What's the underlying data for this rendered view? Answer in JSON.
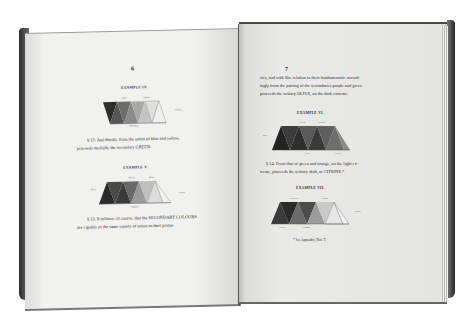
{
  "photo": {
    "subject": "Open antique book on color theory showing triangle color diagrams",
    "background_color": "#ffffff"
  },
  "left_page": {
    "page_number": "6",
    "example_iv": {
      "title": "EXAMPLE IV.",
      "labels": [
        "Red",
        "Yellow",
        "Yellow",
        "ORANGE"
      ]
    },
    "para_13": [
      "§ 13. And thirdly, from the union of blue and yellow,",
      "proceeds medially the secondary GREEN."
    ],
    "example_v": {
      "title": "EXAMPLE V.",
      "labels": [
        "Blue",
        "Yellow",
        "Blue",
        "Green",
        "GREEN"
      ]
    },
    "para_14a": [
      "§ 13. It follows, of course, that the SECONDARY COLOURS",
      "are capable of the same variety of union as their prima-"
    ]
  },
  "right_page": {
    "page_number": "7",
    "para_cont": [
      "ries, and with like relation to their fundamentals: accord-",
      "ingly from the pairing of the secondaries purple and green",
      "proceeds the tertiary OLIVE, on the dark extreme."
    ],
    "example_vi": {
      "title": "EXAMPLE VI.",
      "labels": [
        "Blue",
        "Green",
        "Purple",
        "Olive",
        "Green"
      ]
    },
    "para_14": [
      "§ 14. From that of green and orange, on the light ex-",
      "treme, proceeds the tertiary drab, or CITRINE.*"
    ],
    "example_vii": {
      "title": "EXAMPLE VII.",
      "labels": [
        "CITRINE",
        "Yellow",
        "White",
        "Green",
        "Orange"
      ]
    },
    "footnote": "* See Appendix, Note T."
  }
}
